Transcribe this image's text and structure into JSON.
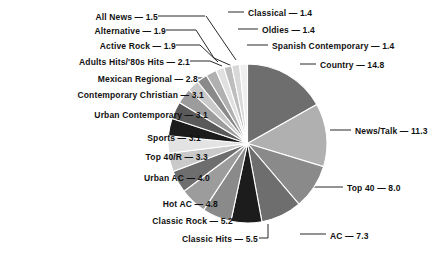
{
  "chart_data": {
    "type": "pie",
    "title": "",
    "subtitle": "",
    "xlabel": "",
    "ylabel": "",
    "units": "percent",
    "legend_position": "callout-labels",
    "grid": false,
    "label_separator": "—",
    "start_angle_deg": 0,
    "direction": "clockwise",
    "categories": [
      "Country",
      "News/Talk",
      "Top 40",
      "AC",
      "Classic Hits",
      "Classic Rock",
      "Hot AC",
      "Urban AC",
      "Top 40/R",
      "Sports",
      "Urban Contemporary",
      "Contemporary Christian",
      "Mexican Regional",
      "Adults Hits/'80s Hits",
      "Active Rock",
      "Alternative",
      "All News",
      "Classical",
      "Oldies",
      "Spanish Contemporary"
    ],
    "values": [
      14.8,
      11.3,
      8.0,
      7.3,
      5.5,
      5.2,
      4.8,
      4.0,
      3.3,
      3.1,
      3.1,
      3.1,
      2.8,
      2.1,
      1.9,
      1.9,
      1.5,
      1.4,
      1.4,
      1.4
    ],
    "colors": [
      "#6e6e6e",
      "#b0b0b0",
      "#8a8a8a",
      "#6e6e6e",
      "#1c1c1c",
      "#8a8a8a",
      "#9c9c9c",
      "#6e6e6e",
      "#c9c9c9",
      "#e3e3e3",
      "#1c1c1c",
      "#5a5a5a",
      "#9c9c9c",
      "#c9c9c9",
      "#8a8a8a",
      "#b0b0b0",
      "#e0e0e0",
      "#bdbdbd",
      "#d8d8d8",
      "#efefef"
    ],
    "slice_border_color": "#ffffff"
  },
  "labels": {
    "left": [
      {
        "name": "All News",
        "value": "1.5",
        "text": "All News — 1.5"
      },
      {
        "name": "Alternative",
        "value": "1.9",
        "text": "Alternative — 1.9"
      },
      {
        "name": "Active Rock",
        "value": "1.9",
        "text": "Active Rock — 1.9"
      },
      {
        "name": "Adults Hits/'80s Hits",
        "value": "2.1",
        "text": "Adults Hits/'80s Hits — 2.1"
      },
      {
        "name": "Mexican Regional",
        "value": "2.8",
        "text": "Mexican Regional — 2.8"
      },
      {
        "name": "Contemporary Christian",
        "value": "3.1",
        "text": "Contemporary Christian — 3.1"
      },
      {
        "name": "Urban Contemporary",
        "value": "3.1",
        "text": "Urban Contemporary — 3.1"
      },
      {
        "name": "Sports",
        "value": "3.1",
        "text": "Sports — 3.1"
      },
      {
        "name": "Top 40/R",
        "value": "3.3",
        "text": "Top 40/R — 3.3"
      },
      {
        "name": "Urban AC",
        "value": "4.0",
        "text": "Urban AC — 4.0"
      },
      {
        "name": "Hot AC",
        "value": "4.8",
        "text": "Hot AC — 4.8"
      },
      {
        "name": "Classic Rock",
        "value": "5.2",
        "text": "Classic Rock — 5.2"
      },
      {
        "name": "Classic Hits",
        "value": "5.5",
        "text": "Classic Hits — 5.5"
      }
    ],
    "right": [
      {
        "name": "Classical",
        "value": "1.4",
        "text": "Classical — 1.4"
      },
      {
        "name": "Oldies",
        "value": "1.4",
        "text": "Oldies — 1.4"
      },
      {
        "name": "Spanish Contemporary",
        "value": "1.4",
        "text": "Spanish Contemporary — 1.4"
      },
      {
        "name": "Country",
        "value": "14.8",
        "text": "Country — 14.8"
      },
      {
        "name": "News/Talk",
        "value": "11.3",
        "text": "News/Talk — 11.3"
      },
      {
        "name": "Top 40",
        "value": "8.0",
        "text": "Top 40 — 8.0"
      },
      {
        "name": "AC",
        "value": "7.3",
        "text": "AC — 7.3"
      }
    ]
  }
}
